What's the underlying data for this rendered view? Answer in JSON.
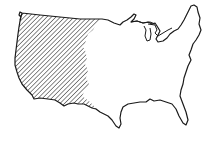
{
  "map": {
    "subject": "Contiguous United States outline",
    "highlighted_region": "Western United States",
    "highlight_style": "diagonal hatching",
    "colors": {
      "outline": "#1a1a1a",
      "hatch": "#2a2a2a",
      "land": "#ffffff",
      "background": "#ffffff"
    }
  }
}
